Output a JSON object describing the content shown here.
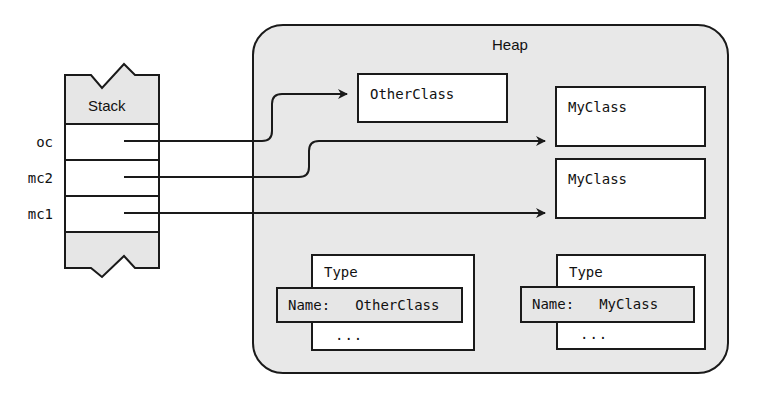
{
  "diagram": {
    "stack": {
      "title": "Stack",
      "fill": "#e6e6e6",
      "slots": [
        {
          "variable": "oc",
          "points_to": "OtherClass"
        },
        {
          "variable": "mc2",
          "points_to": "MyClass (top)"
        },
        {
          "variable": "mc1",
          "points_to": "MyClass (bottom)"
        }
      ]
    },
    "heap": {
      "title": "Heap",
      "fill": "#e8e8e8",
      "objects": [
        {
          "id": "otherclass-obj",
          "label": "OtherClass"
        },
        {
          "id": "myclass-obj-1",
          "label": "MyClass"
        },
        {
          "id": "myclass-obj-2",
          "label": "MyClass"
        }
      ],
      "type_objects": [
        {
          "title": "Type",
          "name_key": "Name:",
          "name_value": "OtherClass",
          "ellipsis": "..."
        },
        {
          "title": "Type",
          "name_key": "Name:",
          "name_value": "MyClass",
          "ellipsis": "..."
        }
      ]
    },
    "colors": {
      "stroke": "#1a1a1a",
      "box_fill": "#ffffff",
      "gray_fill": "#e6e6e6"
    }
  }
}
